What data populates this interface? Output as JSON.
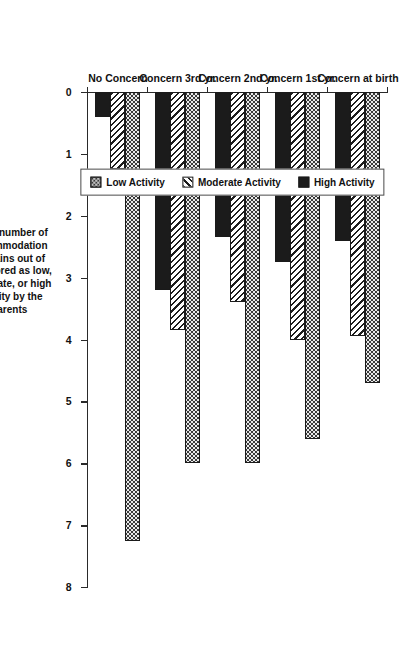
{
  "chart_data": {
    "type": "bar",
    "orientation": "horizontal-grouped",
    "title": "",
    "xlabel": "Mean number of accommodation domains out of 12, scored as low, moderate, or high activity by the parents",
    "ylabel": "",
    "categories": [
      "Concern at birth",
      "Concern 1st yr.",
      "Concern 2nd yr.",
      "Concern 3rd yr.",
      "No Concern"
    ],
    "series": [
      {
        "name": "Low Activity",
        "values": [
          4.7,
          5.6,
          6.0,
          6.0,
          7.25
        ]
      },
      {
        "name": "Moderate Activity",
        "values": [
          3.95,
          4.0,
          3.4,
          3.85,
          1.25
        ]
      },
      {
        "name": "High Activity",
        "values": [
          2.4,
          2.75,
          2.35,
          3.2,
          0.4
        ]
      }
    ],
    "xlim": [
      0,
      8
    ],
    "xticks": [
      0,
      1,
      2,
      3,
      4,
      5,
      6,
      7,
      8
    ],
    "xticklabels": [
      "0",
      "1",
      "2",
      "3",
      "4",
      "5",
      "6",
      "7",
      "8"
    ],
    "grid": false,
    "legend_position": "top-left-outside"
  },
  "axis": {
    "title_lines": [
      "Mean number of",
      "accommodation",
      "domains out of",
      "12, scored as low,",
      "moderate, or high",
      "activity by the",
      "parents"
    ],
    "title_text": "Mean number of accommodation domains out of 12, scored as low, moderate, or high activity by the parents",
    "ticks": [
      "0",
      "1",
      "2",
      "3",
      "4",
      "5",
      "6",
      "7",
      "8"
    ]
  },
  "legend": {
    "items": [
      {
        "label": "Low Activity",
        "pattern": "checker-dark",
        "color": "#3a3a3a"
      },
      {
        "label": "Moderate Activity",
        "pattern": "diagonal-hatch",
        "color": "#1d1d1d"
      },
      {
        "label": "High Activity",
        "pattern": "solid-dark",
        "color": "#1b1b1b"
      }
    ]
  },
  "categories": [
    {
      "label": "Concern at birth"
    },
    {
      "label": "Concern 1st yr."
    },
    {
      "label": "Concern 2nd yr."
    },
    {
      "label": "Concern 3rd yr."
    },
    {
      "label": "No Concern"
    }
  ]
}
